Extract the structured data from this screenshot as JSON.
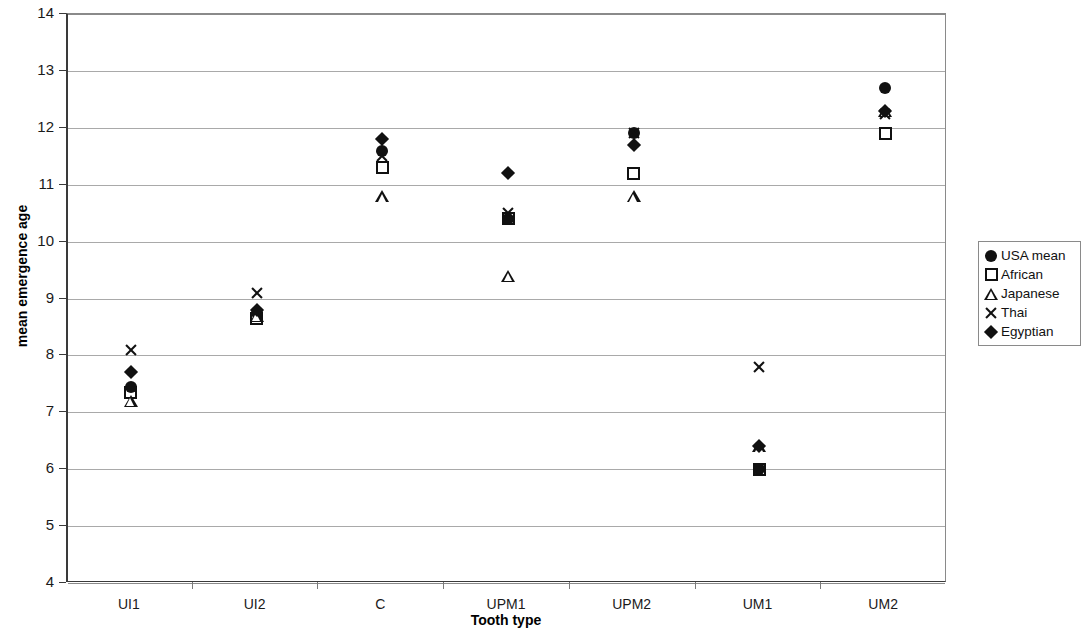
{
  "chart_data": {
    "type": "scatter",
    "title": "",
    "xlabel": "Tooth type",
    "ylabel": "mean emergence age",
    "categories": [
      "UI1",
      "UI2",
      "C",
      "UPM1",
      "UPM2",
      "UM1",
      "UM2"
    ],
    "ylim": [
      4,
      14
    ],
    "yticks": [
      4,
      5,
      6,
      7,
      8,
      9,
      10,
      11,
      12,
      13,
      14
    ],
    "grid": true,
    "legend_position": "right",
    "series": [
      {
        "name": "USA mean",
        "marker": "filled-circle",
        "color": "#111111",
        "values": [
          7.45,
          8.75,
          11.6,
          10.4,
          11.9,
          6.0,
          12.7
        ]
      },
      {
        "name": "African",
        "marker": "open-square",
        "color": "#111111",
        "values": [
          7.35,
          8.65,
          11.3,
          10.4,
          11.2,
          6.0,
          11.9
        ]
      },
      {
        "name": "Japanese",
        "marker": "open-triangle",
        "color": "#111111",
        "values": [
          7.2,
          8.7,
          10.8,
          9.4,
          10.8,
          6.4,
          12.3
        ]
      },
      {
        "name": "Thai",
        "marker": "cross-x",
        "color": "#111111",
        "values": [
          8.1,
          9.1,
          11.5,
          10.5,
          11.9,
          7.8,
          12.25
        ]
      },
      {
        "name": "Egyptian",
        "marker": "filled-diamond",
        "color": "#111111",
        "values": [
          7.7,
          8.8,
          11.8,
          11.2,
          11.7,
          6.4,
          12.3
        ]
      }
    ]
  }
}
